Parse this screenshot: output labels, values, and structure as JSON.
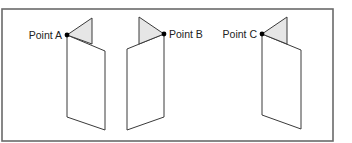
{
  "figure": {
    "points": [
      {
        "id": "A",
        "label": "Point A",
        "label_side": "left"
      },
      {
        "id": "B",
        "label": "Point B",
        "label_side": "right"
      },
      {
        "id": "C",
        "label": "Point C",
        "label_side": "left"
      }
    ],
    "colors": {
      "flap_fill": "#e6e6e6",
      "panel_fill": "#ffffff",
      "stroke": "#3a3a3a",
      "frame": "#6a6a6a",
      "point": "#000000"
    }
  }
}
